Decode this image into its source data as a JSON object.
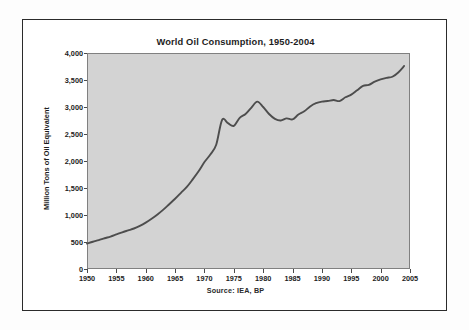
{
  "figure": {
    "source_note": "Source:   IEA, BP"
  },
  "chart_data": {
    "type": "line",
    "title": "World Oil Consumption, 1950-2004",
    "xlabel": "",
    "ylabel": "Million Tons of Oil Equivalent",
    "xlim": [
      1950,
      2005
    ],
    "ylim": [
      0,
      4000
    ],
    "grid": false,
    "legend": null,
    "line_color": "#4d4d4d",
    "plot_background": "#d3d3d3",
    "x_tick_labels": [
      "1950",
      "1955",
      "1960",
      "1965",
      "1970",
      "1975",
      "1980",
      "1985",
      "1990",
      "1995",
      "2000",
      "2005"
    ],
    "x_ticks": [
      1950,
      1955,
      1960,
      1965,
      1970,
      1975,
      1980,
      1985,
      1990,
      1995,
      2000,
      2005
    ],
    "y_tick_labels": [
      "0",
      "500",
      "1,000",
      "1,500",
      "2,000",
      "2,500",
      "3,000",
      "3,500",
      "4,000"
    ],
    "y_ticks": [
      0,
      500,
      1000,
      1500,
      2000,
      2500,
      3000,
      3500,
      4000
    ],
    "series": [
      {
        "name": "World oil consumption",
        "x": [
          1950,
          1951,
          1952,
          1953,
          1954,
          1955,
          1956,
          1957,
          1958,
          1959,
          1960,
          1961,
          1962,
          1963,
          1964,
          1965,
          1966,
          1967,
          1968,
          1969,
          1970,
          1971,
          1972,
          1973,
          1974,
          1975,
          1976,
          1977,
          1978,
          1979,
          1980,
          1981,
          1982,
          1983,
          1984,
          1985,
          1986,
          1987,
          1988,
          1989,
          1990,
          1991,
          1992,
          1993,
          1994,
          1995,
          1996,
          1997,
          1998,
          1999,
          2000,
          2001,
          2002,
          2003,
          2004
        ],
        "values": [
          470,
          505,
          535,
          570,
          600,
          640,
          680,
          715,
          750,
          800,
          860,
          930,
          1010,
          1100,
          1200,
          1300,
          1410,
          1520,
          1660,
          1810,
          1980,
          2120,
          2300,
          2760,
          2700,
          2650,
          2800,
          2870,
          2990,
          3100,
          3000,
          2870,
          2780,
          2750,
          2790,
          2770,
          2860,
          2920,
          3010,
          3070,
          3100,
          3110,
          3130,
          3110,
          3180,
          3230,
          3310,
          3390,
          3410,
          3470,
          3510,
          3540,
          3560,
          3640,
          3760
        ]
      }
    ]
  }
}
